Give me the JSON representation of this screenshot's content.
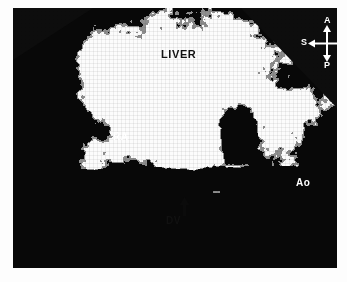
{
  "image": {
    "modality": "ultrasound",
    "view": "b-mode-sector-scan",
    "frame": {
      "x": 13,
      "y": 8,
      "width": 324,
      "height": 260
    },
    "background_color": "#ffffff",
    "tissue_light_color": "#f2f2f2",
    "tissue_dark_color": "#101010"
  },
  "annotations": [
    {
      "name": "liver",
      "label": "LIVER",
      "tone": "dark",
      "x": 148,
      "y": 41,
      "font_size": 11
    },
    {
      "name": "right-atrium",
      "label": "RA",
      "tone": "light",
      "x": 100,
      "y": 124,
      "font_size": 10
    },
    {
      "name": "aorta",
      "label": "Ao",
      "tone": "light",
      "x": 283,
      "y": 170,
      "font_size": 10
    },
    {
      "name": "ductus-venosus",
      "label": "DV",
      "tone": "dark",
      "x": 153,
      "y": 208,
      "font_size": 10,
      "marker": "up-arrow"
    }
  ],
  "labels": {
    "liver": "LIVER",
    "right_atrium": "RA",
    "aorta": "Ao",
    "ductus_venosus": "DV"
  },
  "compass": {
    "anterior": "A",
    "posterior": "P",
    "superior": "S",
    "inferior": "I",
    "color": "#ffffff",
    "x": 288,
    "y": 8
  }
}
